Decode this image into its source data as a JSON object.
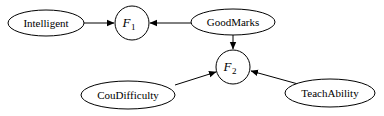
{
  "diagram": {
    "type": "directed-graph",
    "nodes": [
      {
        "id": "intelligent",
        "label": "Intelligent",
        "shape": "ellipse"
      },
      {
        "id": "f1",
        "label": "F",
        "subscript": "1",
        "shape": "circle"
      },
      {
        "id": "goodmarks",
        "label": "GoodMarks",
        "shape": "ellipse"
      },
      {
        "id": "f2",
        "label": "F",
        "subscript": "2",
        "shape": "circle"
      },
      {
        "id": "coudifficulty",
        "label": "CouDifficulty",
        "shape": "ellipse"
      },
      {
        "id": "teachability",
        "label": "TeachAbility",
        "shape": "ellipse"
      }
    ],
    "edges": [
      {
        "from": "Intelligent",
        "to": "F1"
      },
      {
        "from": "GoodMarks",
        "to": "F1"
      },
      {
        "from": "GoodMarks",
        "to": "F2"
      },
      {
        "from": "CouDifficulty",
        "to": "F2"
      },
      {
        "from": "TeachAbility",
        "to": "F2"
      }
    ],
    "colors": {
      "stroke": "#000000",
      "background": "#ffffff"
    }
  }
}
